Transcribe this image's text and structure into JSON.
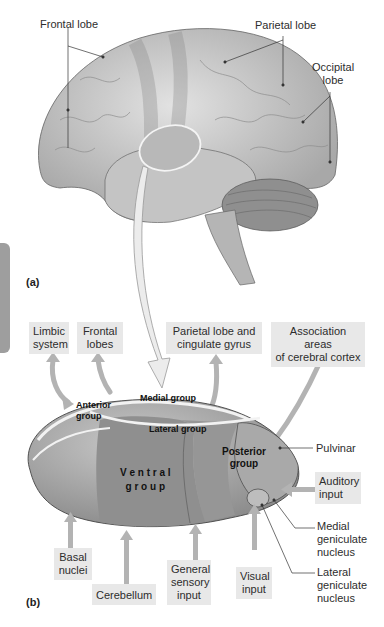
{
  "panel_a": {
    "label": "(a)",
    "labels": {
      "frontal": "Frontal lobe",
      "parietal": "Parietal lobe",
      "occipital_1": "Occipital",
      "occipital_2": "lobe"
    }
  },
  "panel_b": {
    "label": "(b)",
    "targets": {
      "limbic_1": "Limbic",
      "limbic_2": "system",
      "frontal_1": "Frontal",
      "frontal_2": "lobes",
      "parietal_1": "Parietal lobe and",
      "parietal_2": "cingulate gyrus",
      "assoc_1": "Association areas",
      "assoc_2": "of cerebral cortex"
    },
    "regions": {
      "anterior_1": "Anterior",
      "anterior_2": "group",
      "medial": "Medial group",
      "lateral": "Lateral group",
      "posterior_1": "Posterior",
      "posterior_2": "group",
      "ventral_1": "V e n t r a l",
      "ventral_2": "g r o u p"
    },
    "side_labels": {
      "pulvinar": "Pulvinar",
      "medial_gen_1": "Medial",
      "medial_gen_2": "geniculate",
      "medial_gen_3": "nucleus",
      "lateral_gen_1": "Lateral",
      "lateral_gen_2": "geniculate",
      "lateral_gen_3": "nucleus"
    },
    "inputs": {
      "auditory_1": "Auditory",
      "auditory_2": "input",
      "basal_1": "Basal",
      "basal_2": "nuclei",
      "cerebellum": "Cerebellum",
      "general_1": "General",
      "general_2": "sensory",
      "general_3": "input",
      "visual_1": "Visual",
      "visual_2": "input"
    }
  },
  "colors": {
    "brain": "#cfcfcf",
    "brain_dark": "#a9a9a9",
    "arrow": "#b3b3b3",
    "box": "#e8e8e8",
    "thalamus": "#b0b0b0",
    "ventral": "#8f8f8f"
  }
}
